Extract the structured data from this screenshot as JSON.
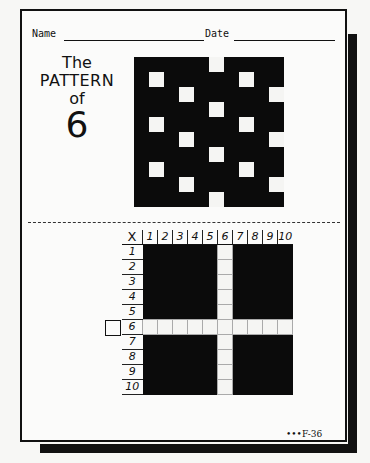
{
  "header": {
    "name_label": "Name",
    "date_label": "Date"
  },
  "title": {
    "line1": "The",
    "line2": "PATTERN",
    "line3": "of",
    "line4": "6"
  },
  "pattern_grid": {
    "size": 10,
    "highlighted_numbers": [
      6,
      12,
      18,
      24,
      30,
      36,
      42,
      48,
      54,
      60,
      66,
      72,
      78,
      84,
      90,
      96
    ],
    "colors": {
      "filled": "#0b0b0b",
      "open": "#f5f5f3"
    }
  },
  "multiplication_grid": {
    "corner": "X",
    "columns": [
      "1",
      "2",
      "3",
      "4",
      "5",
      "6",
      "7",
      "8",
      "9",
      "10"
    ],
    "rows": [
      "1",
      "2",
      "3",
      "4",
      "5",
      "6",
      "7",
      "8",
      "9",
      "10"
    ],
    "open_row": 6,
    "open_column": 6
  },
  "answer_box": {
    "value": ""
  },
  "footer": {
    "code": "•••F-36"
  }
}
